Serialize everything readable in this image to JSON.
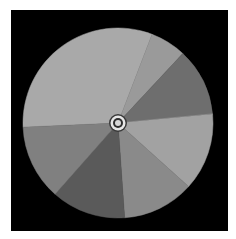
{
  "wheel": {
    "center": [
      118,
      123
    ],
    "radius": 95,
    "background": "#000000",
    "segments": [
      {
        "name": "segment-a",
        "start": 177.5,
        "end": 291,
        "color": "#a9a9a9"
      },
      {
        "name": "segment-b",
        "start": 291,
        "end": 313,
        "color": "#9a9a9a"
      },
      {
        "name": "segment-c",
        "start": 313,
        "end": 354.5,
        "color": "#6e6e6e"
      },
      {
        "name": "segment-d",
        "start": 354.5,
        "end": 402,
        "color": "#a2a2a2"
      },
      {
        "name": "segment-e",
        "start": 402,
        "end": 446,
        "color": "#8a8a8a"
      },
      {
        "name": "segment-f",
        "start": 446,
        "end": 491.5,
        "color": "#5a5a5a"
      },
      {
        "name": "segment-g",
        "start": 491.5,
        "end": 537.5,
        "color": "#808080"
      }
    ],
    "pin": {
      "rings": [
        {
          "r": 9,
          "color": "#3a3a3a"
        },
        {
          "r": 7.5,
          "color": "#e6e6e6"
        },
        {
          "r": 5,
          "color": "#2e2e2e"
        },
        {
          "r": 3,
          "color": "#d8d8d8"
        }
      ]
    }
  }
}
